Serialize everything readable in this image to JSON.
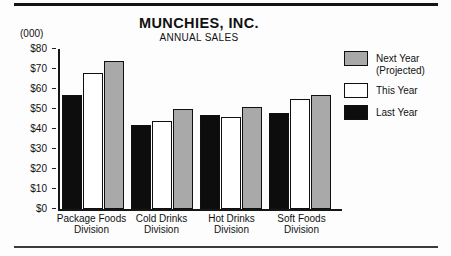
{
  "header": {
    "title": "MUNCHIES, INC.",
    "subtitle": "ANNUAL SALES",
    "units_label": "(000)"
  },
  "legend": {
    "position": "right",
    "items": [
      {
        "line1": "Next Year",
        "line2": "(Projected)",
        "swatch_color": "#a9a9a9"
      },
      {
        "line1": "This Year",
        "line2": "",
        "swatch_color": "#ffffff"
      },
      {
        "line1": "Last Year",
        "line2": "",
        "swatch_color": "#0d0d0d"
      }
    ]
  },
  "colors": {
    "bar_last_year": "#0d0d0d",
    "bar_this_year": "#ffffff",
    "bar_next_year": "#a9a9a9",
    "axis": "#161616",
    "rule_top": "#141414",
    "rule_bottom": "#3c3c3c"
  },
  "chart_data": {
    "type": "bar",
    "title": "MUNCHIES, INC.",
    "subtitle": "ANNUAL SALES",
    "units": "(000)",
    "categories": [
      "Package Foods Division",
      "Cold Drinks Division",
      "Hot Drinks Division",
      "Soft Foods Division"
    ],
    "category_lines": [
      [
        "Package Foods",
        "Division"
      ],
      [
        "Cold Drinks",
        "Division"
      ],
      [
        "Hot Drinks",
        "Division"
      ],
      [
        "Soft Foods",
        "Division"
      ]
    ],
    "series": [
      {
        "name": "Last Year",
        "color": "#0d0d0d",
        "values": [
          57,
          42,
          47,
          48
        ]
      },
      {
        "name": "This Year",
        "color": "#ffffff",
        "values": [
          68,
          44,
          46,
          55
        ]
      },
      {
        "name": "Next Year (Projected)",
        "color": "#a9a9a9",
        "values": [
          74,
          50,
          51,
          57
        ]
      }
    ],
    "ylim": [
      0,
      80
    ],
    "ytick_step": 10,
    "ytick_labels": [
      "$0",
      "$10",
      "$20",
      "$30",
      "$40",
      "$50",
      "$60",
      "$70",
      "$80"
    ],
    "grid": false,
    "legend_position": "right"
  }
}
